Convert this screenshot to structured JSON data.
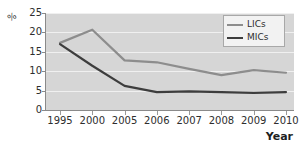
{
  "chart_data": {
    "type": "line",
    "title": "",
    "subtitle": "",
    "xlabel": "Year",
    "ylabel": "%",
    "categories": [
      "1995",
      "2000",
      "2005",
      "2006",
      "2007",
      "2008",
      "2009",
      "2010"
    ],
    "series": [
      {
        "name": "LICs",
        "color": "#8d8d8d",
        "values": [
          17.3,
          20.7,
          12.8,
          12.3,
          10.6,
          9.0,
          10.3,
          9.6
        ]
      },
      {
        "name": "MICs",
        "color": "#3d3d3d",
        "values": [
          17.0,
          11.4,
          6.2,
          4.6,
          4.8,
          4.6,
          4.4,
          4.6
        ]
      }
    ],
    "ylim": [
      0,
      25
    ],
    "yticks": [
      "0",
      "5",
      "10",
      "15",
      "20",
      "25"
    ],
    "ytick_values": [
      0,
      5,
      10,
      15,
      20,
      25
    ],
    "grid": "horizontal",
    "legend_position": "top-right",
    "plot_background": "#d6d6d6",
    "gridline_color": "#f0f0f0",
    "axis_color": "#8a8a8a"
  },
  "legend": {
    "entries": [
      {
        "label": "LICs",
        "color": "#8d8d8d"
      },
      {
        "label": "MICs",
        "color": "#3d3d3d"
      }
    ]
  }
}
